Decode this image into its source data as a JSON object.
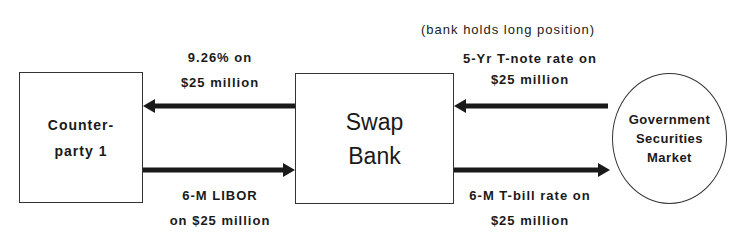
{
  "nodes": {
    "counterparty": {
      "line1": "Counter-",
      "line2": "party 1"
    },
    "swap_bank": {
      "line1": "Swap",
      "line2": "Bank"
    },
    "market": {
      "line1": "Government",
      "line2": "Securities",
      "line3": "Market"
    }
  },
  "annotation": "(bank holds long position)",
  "flows": {
    "bank_to_counterparty": {
      "line1": "9.26% on",
      "line2": "$25 million",
      "direction": "left"
    },
    "counterparty_to_bank": {
      "line1": "6-M LIBOR",
      "line2": "on $25 million",
      "direction": "right"
    },
    "market_to_bank": {
      "line1": "5-Yr T-note rate on",
      "line2": "$25 million",
      "direction": "left"
    },
    "bank_to_market": {
      "line1": "6-M T-bill rate on",
      "line2": "$25 million",
      "direction": "right"
    }
  },
  "colors": {
    "line": "#1a1a1a",
    "background": "#ffffff"
  }
}
